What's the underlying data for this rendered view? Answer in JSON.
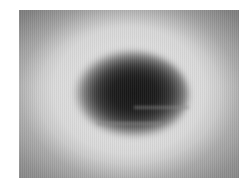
{
  "image": {
    "description": "Grayscale blurred image of a dark elliptical object centered on a light halo over a gray gradient background",
    "colors": {
      "background": "#ffffff",
      "frame_corner": "#9a9a9a",
      "halo": "#e6e6e6",
      "object_core": "#161616"
    }
  }
}
